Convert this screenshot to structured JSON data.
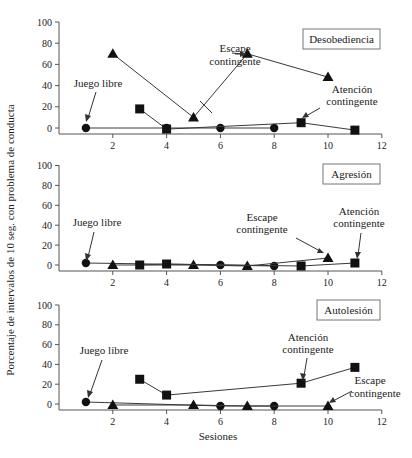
{
  "chart_data": [
    {
      "type": "line",
      "title": "Desobediencia",
      "xlabel": "",
      "ylabel": "Porcentaje de intervalos de 10 seg. con problema de conducta",
      "xlim": [
        0,
        12
      ],
      "ylim": [
        0,
        100
      ],
      "xticks": [
        2,
        4,
        6,
        8,
        10,
        12
      ],
      "yticks": [
        0,
        20,
        40,
        60,
        80,
        100
      ],
      "grid": false,
      "series": [
        {
          "name": "Juego libre",
          "marker": "circle",
          "x": [
            1,
            4,
            6,
            8
          ],
          "y": [
            0,
            0,
            0,
            0
          ]
        },
        {
          "name": "Escape contingente",
          "marker": "triangle",
          "x": [
            2,
            5,
            7,
            10
          ],
          "y": [
            70,
            10,
            70,
            48
          ]
        },
        {
          "name": "Atención contingente",
          "marker": "square",
          "x": [
            3,
            4,
            9,
            11
          ],
          "y": [
            18,
            -1,
            5,
            -2
          ]
        }
      ],
      "annotations": [
        {
          "text": "Juego libre",
          "series": "Juego libre"
        },
        {
          "text": "Escape contingente",
          "series": "Escape contingente"
        },
        {
          "text": "Atención contingente",
          "series": "Atención contingente"
        }
      ]
    },
    {
      "type": "line",
      "title": "Agresión",
      "xlim": [
        0,
        12
      ],
      "ylim": [
        0,
        100
      ],
      "xticks": [
        2,
        4,
        6,
        8,
        10,
        12
      ],
      "yticks": [
        0,
        20,
        40,
        60,
        80,
        100
      ],
      "grid": false,
      "series": [
        {
          "name": "Juego libre",
          "marker": "circle",
          "x": [
            1,
            6,
            8
          ],
          "y": [
            2,
            0,
            -1
          ]
        },
        {
          "name": "Escape contingente",
          "marker": "triangle",
          "x": [
            2,
            5,
            7,
            10
          ],
          "y": [
            0,
            0,
            -1,
            7
          ]
        },
        {
          "name": "Atención contingente",
          "marker": "square",
          "x": [
            3,
            4,
            9,
            11
          ],
          "y": [
            0,
            1,
            -1,
            2
          ]
        }
      ],
      "annotations": [
        {
          "text": "Juego libre",
          "series": "Juego libre"
        },
        {
          "text": "Escape contingente",
          "series": "Escape contingente"
        },
        {
          "text": "Atención contingente",
          "series": "Atención contingente"
        }
      ]
    },
    {
      "type": "line",
      "title": "Autolesión",
      "xlabel": "Sesiones",
      "xlim": [
        0,
        12
      ],
      "ylim": [
        0,
        100
      ],
      "xticks": [
        2,
        4,
        6,
        8,
        10,
        12
      ],
      "yticks": [
        0,
        20,
        40,
        60,
        80,
        100
      ],
      "grid": false,
      "series": [
        {
          "name": "Juego libre",
          "marker": "circle",
          "x": [
            1,
            6,
            8
          ],
          "y": [
            2,
            -2,
            -2
          ]
        },
        {
          "name": "Escape contingente",
          "marker": "triangle",
          "x": [
            2,
            5,
            7,
            10
          ],
          "y": [
            -1,
            -1,
            -2,
            -2
          ]
        },
        {
          "name": "Atención contingente",
          "marker": "square",
          "x": [
            3,
            4,
            9,
            11
          ],
          "y": [
            25,
            9,
            21,
            37
          ]
        }
      ],
      "annotations": [
        {
          "text": "Juego libre",
          "series": "Juego libre"
        },
        {
          "text": "Atención contingente",
          "series": "Atención contingente"
        },
        {
          "text": "Escape contingente",
          "series": "Escape contingente"
        }
      ]
    }
  ],
  "labels": {
    "ylabel": "Porcentaje de intervalos de 10 seg. con problema de conducta",
    "xlabel": "Sesiones",
    "juego_libre": "Juego libre",
    "escape_1": "Escape",
    "escape_2": "contingente",
    "atencion_1": "Atención",
    "atencion_2": "contingente",
    "panel1": "Desobediencia",
    "panel2": "Agresión",
    "panel3": "Autolesión"
  },
  "style": {
    "line_color": "#3a3a3a",
    "marker_color": "#111111",
    "axis_color": "#555555"
  }
}
